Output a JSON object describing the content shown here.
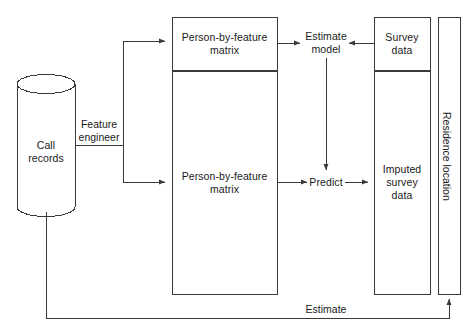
{
  "diagram": {
    "canvas": {
      "width": 472,
      "height": 332
    },
    "colors": {
      "background": "#ffffff",
      "stroke": "#3a3a3a",
      "text": "#1a1a1a"
    },
    "nodes": {
      "call_records": {
        "label": "Call\nrecords",
        "shape": "cylinder"
      },
      "person_by_feature_train": {
        "label": "Person-by-feature\nmatrix",
        "shape": "rectangle"
      },
      "person_by_feature_apply": {
        "label": "Person-by-feature\nmatrix",
        "shape": "rectangle"
      },
      "survey_data": {
        "label": "Survey\ndata",
        "shape": "rectangle"
      },
      "imputed_survey_data": {
        "label": "Imputed\nsurvey\ndata",
        "shape": "rectangle"
      },
      "residence_location": {
        "label": "Residence location",
        "shape": "rectangle-vertical"
      },
      "estimate_model": {
        "label": "Estimate\nmodel",
        "shape": "text"
      },
      "predict": {
        "label": "Predict",
        "shape": "text"
      }
    },
    "edges": {
      "feature_engineer": {
        "label": "Feature\nengineer"
      },
      "estimate_return": {
        "label": "Estimate"
      },
      "records_to_matrix_top": {
        "label": ""
      },
      "records_to_matrix_bottom": {
        "label": ""
      },
      "matrix_to_estimate_model": {
        "label": ""
      },
      "survey_to_estimate_model": {
        "label": ""
      },
      "model_to_predict": {
        "label": ""
      },
      "matrix_to_predict": {
        "label": ""
      },
      "predict_to_imputed": {
        "label": ""
      }
    }
  }
}
